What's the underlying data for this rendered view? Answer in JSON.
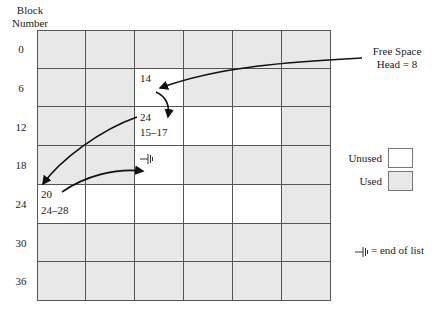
{
  "header": {
    "line1": "Block",
    "line2": "Number"
  },
  "row_labels": [
    "0",
    "6",
    "12",
    "18",
    "24",
    "30",
    "36"
  ],
  "grid": {
    "columns": 6,
    "rows": 7,
    "unused_cells": [
      [
        1,
        2
      ],
      [
        2,
        2
      ],
      [
        2,
        3
      ],
      [
        2,
        4
      ],
      [
        3,
        2
      ],
      [
        4,
        0
      ],
      [
        4,
        1
      ],
      [
        4,
        2
      ],
      [
        4,
        3
      ],
      [
        4,
        4
      ]
    ]
  },
  "cell_texts": {
    "block8_next": "14",
    "block14_next": "24",
    "block14_range": "15–17",
    "block20_end": "─╡",
    "block24_next": "20",
    "block24_range": "24–28"
  },
  "free_space": {
    "line1": "Free Space",
    "line2": "Head = 8"
  },
  "legend": {
    "unused_label": "Unused",
    "used_label": "Used",
    "unused_color": "#ffffff",
    "used_color": "#e8e8e8"
  },
  "end_of_list_note": "= end of list",
  "colors": {
    "grid_line": "#555555",
    "used_fill": "#e8e8e8",
    "arrow": "#111111"
  }
}
